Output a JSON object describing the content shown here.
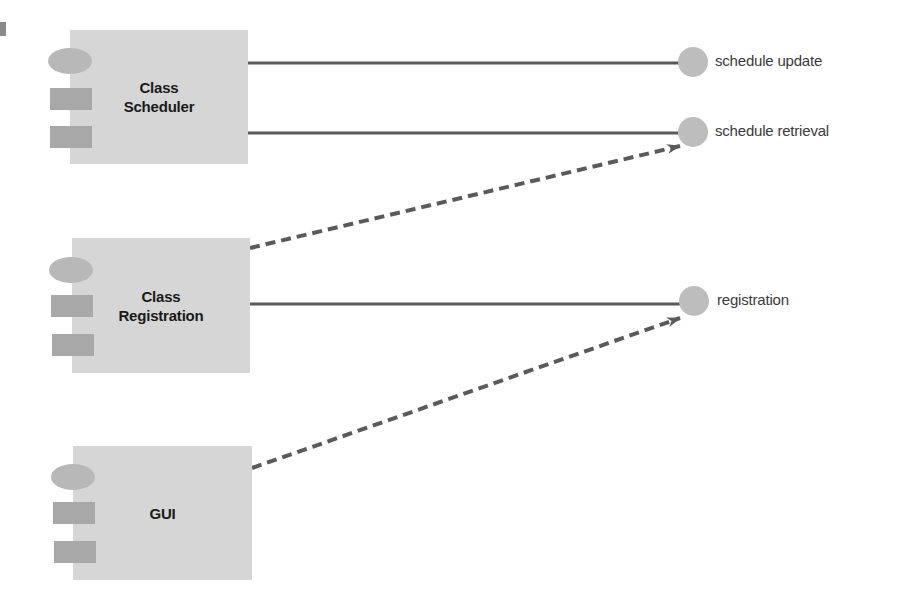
{
  "diagram": {
    "type": "UML component diagram",
    "colors": {
      "component_fill": "#d6d6d6",
      "port_oval": "#b8b8b8",
      "port_rect": "#a8a8a8",
      "interface_circle": "#bdbdbd",
      "connector": "#5a5a5a",
      "text_dark": "#1a1a1a",
      "text_label": "#3a3a3a"
    },
    "components": [
      {
        "id": "class-scheduler",
        "label": "Class\nScheduler"
      },
      {
        "id": "class-registration",
        "label": "Class\nRegistration"
      },
      {
        "id": "gui",
        "label": "GUI"
      }
    ],
    "interfaces": [
      {
        "id": "schedule-update",
        "label": "schedule update"
      },
      {
        "id": "schedule-retrieval",
        "label": "schedule retrieval"
      },
      {
        "id": "registration",
        "label": "registration"
      }
    ],
    "connections": [
      {
        "from": "class-scheduler",
        "to": "schedule-update",
        "style": "solid",
        "kind": "realization"
      },
      {
        "from": "class-scheduler",
        "to": "schedule-retrieval",
        "style": "solid",
        "kind": "realization"
      },
      {
        "from": "class-registration",
        "to": "schedule-retrieval",
        "style": "dashed-arrow",
        "kind": "dependency"
      },
      {
        "from": "class-registration",
        "to": "registration",
        "style": "solid",
        "kind": "realization"
      },
      {
        "from": "gui",
        "to": "registration",
        "style": "dashed-arrow",
        "kind": "dependency"
      }
    ]
  }
}
